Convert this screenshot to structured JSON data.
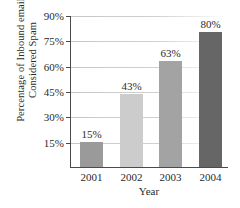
{
  "chart_data": {
    "type": "bar",
    "title": "",
    "xlabel": "Year",
    "ylabel_line1": "Percentage of Inbound email",
    "ylabel_line2": "Considered Spam",
    "categories": [
      "2001",
      "2002",
      "2003",
      "2004"
    ],
    "values": [
      15,
      43,
      63,
      80
    ],
    "data_labels": [
      "15%",
      "43%",
      "63%",
      "80%"
    ],
    "ylim": [
      0,
      90
    ],
    "yticks": [
      90,
      75,
      60,
      45,
      30,
      15
    ],
    "ytick_labels": [
      "90%",
      "75%",
      "60%",
      "45%",
      "30%",
      "15%"
    ],
    "grid": true,
    "legend": "none",
    "bar_colors": [
      "#9a9a9a",
      "#cccccc",
      "#a3a3a3",
      "#666666"
    ]
  }
}
